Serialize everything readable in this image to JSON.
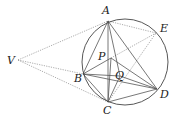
{
  "diagram": {
    "type": "geometry",
    "circle": {
      "cx": 125,
      "cy": 62,
      "r": 43
    },
    "points": {
      "A": {
        "x": 108,
        "y": 21,
        "label": "A",
        "lx": 102,
        "ly": 14
      },
      "E": {
        "x": 156,
        "y": 33,
        "label": "E",
        "lx": 160,
        "ly": 32
      },
      "V": {
        "x": 18,
        "y": 60,
        "label": "V",
        "lx": 7,
        "ly": 64
      },
      "P": {
        "x": 111,
        "y": 58,
        "label": "P",
        "lx": 98,
        "ly": 60
      },
      "B": {
        "x": 83,
        "y": 74,
        "label": "B",
        "lx": 74,
        "ly": 82
      },
      "Q": {
        "x": 120,
        "y": 76,
        "label": "Q",
        "lx": 115,
        "ly": 79
      },
      "C": {
        "x": 108,
        "y": 102,
        "label": "C",
        "lx": 103,
        "ly": 114
      },
      "D": {
        "x": 157,
        "y": 89,
        "label": "D",
        "lx": 160,
        "ly": 98
      }
    },
    "solid_segments": [
      [
        "A",
        "B"
      ],
      [
        "A",
        "C"
      ],
      [
        "A",
        "D"
      ],
      [
        "A",
        "Q"
      ],
      [
        "P",
        "B"
      ],
      [
        "P",
        "D"
      ],
      [
        "P",
        "C"
      ],
      [
        "B",
        "D"
      ],
      [
        "B",
        "C"
      ],
      [
        "B",
        "Q"
      ],
      [
        "C",
        "D"
      ],
      [
        "Q",
        "C"
      ],
      [
        "Q",
        "D"
      ]
    ],
    "dotted_segments": [
      [
        "V",
        "A"
      ],
      [
        "V",
        "B"
      ],
      [
        "V",
        "C"
      ],
      [
        "A",
        "E"
      ],
      [
        "P",
        "E"
      ],
      [
        "C",
        "E"
      ]
    ],
    "colors": {
      "line": "#555555",
      "dotted": "#888888",
      "circle": "#444444"
    }
  }
}
